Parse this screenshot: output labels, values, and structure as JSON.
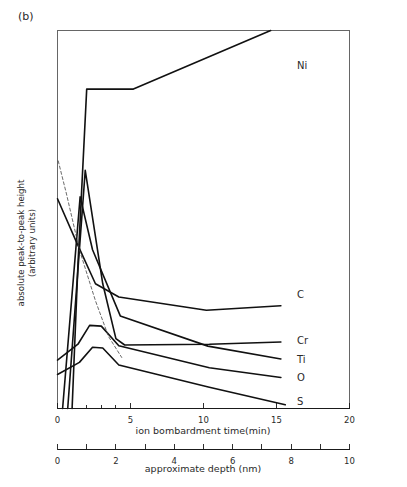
{
  "figure": {
    "panel_tag": "(b)"
  },
  "chart_data": {
    "type": "line",
    "title": "",
    "xlabel": "ion bombardment time(min)",
    "ylabel": "absolute peak-to-peak height\n(arbitrary units)",
    "ylabel_line1": "absolute peak-to-peak height",
    "ylabel_line2": "(arbitrary units)",
    "secondary_xlabel": "approximate depth (nm)",
    "xlim": [
      0,
      20
    ],
    "ylim": [
      0,
      100
    ],
    "secondary_xlim": [
      0,
      10
    ],
    "grid": false,
    "legend_position": "right-inline",
    "xticks": [
      0,
      5,
      10,
      15,
      20
    ],
    "xtick_labels": [
      "0",
      "5",
      "10",
      "15",
      "20"
    ],
    "xminor_ticks": [
      1,
      2,
      3,
      4
    ],
    "secondary_xticks": [
      0,
      1,
      2,
      3,
      4,
      5,
      6,
      7,
      8,
      9,
      10
    ],
    "secondary_xtick_labels": [
      "0",
      "",
      "2",
      "",
      "4",
      "",
      "6",
      "",
      "8",
      "",
      "10"
    ],
    "yticks": [],
    "ytick_labels": [],
    "series": [
      {
        "name": "Ni",
        "label": "Ni",
        "style": "solid",
        "label_x": 16.2,
        "label_y": 90.5,
        "x": [
          1.0,
          1.4,
          2.0,
          5.2,
          14.6
        ],
        "y": [
          0.0,
          38.0,
          84.5,
          84.5,
          100.0
        ]
      },
      {
        "name": "C",
        "label": "C",
        "style": "solid",
        "label_x": 16.2,
        "label_y": 30.0,
        "x": [
          0.0,
          1.3,
          2.6,
          4.2,
          10.2,
          15.3
        ],
        "y": [
          55.5,
          44.0,
          33.0,
          29.5,
          26.0,
          27.2
        ]
      },
      {
        "name": "Cr",
        "label": "Cr",
        "style": "solid",
        "label_x": 16.2,
        "label_y": 17.9,
        "x": [
          0.7,
          1.9,
          3.1,
          4.0,
          4.6,
          10.4,
          15.3
        ],
        "y": [
          0.0,
          63.0,
          33.0,
          18.5,
          16.8,
          17.0,
          17.6
        ]
      },
      {
        "name": "Ti",
        "label": "Ti",
        "style": "solid",
        "label_x": 16.2,
        "label_y": 12.8,
        "x": [
          0.35,
          1.55,
          2.4,
          4.3,
          10.3,
          15.3
        ],
        "y": [
          0.0,
          56.0,
          42.0,
          24.5,
          16.5,
          13.1
        ]
      },
      {
        "name": "O",
        "label": "O",
        "style": "solid",
        "label_x": 16.2,
        "label_y": 8.0,
        "x": [
          0.0,
          1.4,
          2.2,
          3.0,
          4.2,
          10.4,
          15.3
        ],
        "y": [
          12.8,
          17.0,
          22.0,
          21.8,
          16.6,
          10.8,
          8.2
        ]
      },
      {
        "name": "S",
        "label": "S",
        "style": "solid",
        "label_x": 16.2,
        "label_y": 1.6,
        "x": [
          0.0,
          1.5,
          2.4,
          3.1,
          4.2,
          10.4,
          15.6
        ],
        "y": [
          9.0,
          12.2,
          16.2,
          16.0,
          11.5,
          5.6,
          1.0
        ]
      },
      {
        "name": "unlabeled-dashed",
        "label": "",
        "style": "dashed",
        "label_x": null,
        "label_y": null,
        "x": [
          0.05,
          0.6,
          1.5,
          2.6,
          3.5,
          4.4
        ],
        "y": [
          65.5,
          57.0,
          42.0,
          28.5,
          19.0,
          13.5
        ]
      }
    ]
  }
}
